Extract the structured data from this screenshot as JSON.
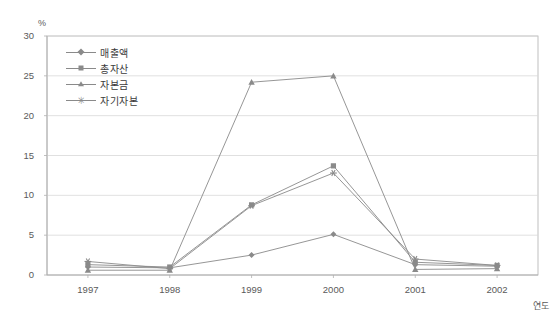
{
  "chart_data": {
    "type": "line",
    "title": "",
    "xlabel": "연도",
    "ylabel": "%",
    "categories": [
      "1997",
      "1998",
      "1999",
      "2000",
      "2001",
      "2002"
    ],
    "ylim": [
      0,
      30
    ],
    "y_ticks": [
      0,
      5,
      10,
      15,
      20,
      25,
      30
    ],
    "grid": true,
    "legend_position": "inside-top-left",
    "series": [
      {
        "name": "매출액",
        "marker": "diamond",
        "values": [
          1.0,
          0.9,
          2.5,
          5.1,
          1.3,
          1.1
        ]
      },
      {
        "name": "총자산",
        "marker": "square",
        "values": [
          1.3,
          1.0,
          8.8,
          13.7,
          1.6,
          1.2
        ]
      },
      {
        "name": "자본금",
        "marker": "triangle",
        "values": [
          0.6,
          0.6,
          24.2,
          25.0,
          0.7,
          0.8
        ]
      },
      {
        "name": "자기자본",
        "marker": "star",
        "values": [
          1.7,
          0.8,
          8.7,
          12.8,
          2.0,
          1.2
        ]
      }
    ],
    "colors": {
      "line": "#8a8a8a",
      "grid": "#d8d8d8",
      "axis": "#b0b0b0",
      "text": "#5a5a5a"
    }
  }
}
